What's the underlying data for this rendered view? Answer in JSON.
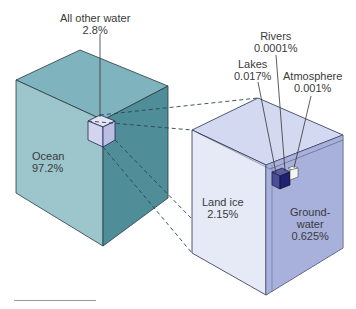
{
  "diagram": {
    "main_cube": {
      "label": "Ocean",
      "value": "97.2%"
    },
    "other_water": {
      "label": "All other water",
      "value": "2.8%"
    },
    "breakdown": [
      {
        "label": "Land ice",
        "value": "2.15%"
      },
      {
        "label": "Ground-",
        "label2": "water",
        "value": "0.625%"
      },
      {
        "label": "Lakes",
        "value": "0.017%"
      },
      {
        "label": "Rivers",
        "value": "0.0001%"
      },
      {
        "label": "Atmosphere",
        "value": "0.001%"
      }
    ],
    "colors": {
      "ocean_top": "#7fb3bd",
      "ocean_left": "#9cc5cc",
      "ocean_right": "#4f8d99",
      "ice_top": "#d3d9f0",
      "ice_left": "#e6eaf7",
      "ice_right": "#a7b1dc",
      "lakes": "#2d2f84",
      "atmosphere": "#f4f4f4"
    }
  }
}
